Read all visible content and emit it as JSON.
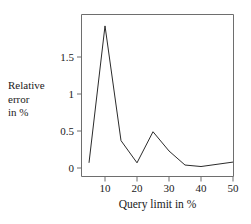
{
  "chart_data": {
    "type": "line",
    "title": "",
    "xlabel": "Query limit in %",
    "ylabel": "Relative error in %",
    "ylabel_lines": [
      "Relative",
      "error",
      "in %"
    ],
    "x": [
      5,
      10,
      15,
      20,
      25,
      30,
      35,
      40,
      45,
      50
    ],
    "values": [
      0.07,
      1.92,
      0.37,
      0.07,
      0.49,
      0.23,
      0.04,
      0.02,
      0.05,
      0.08
    ],
    "series": [
      {
        "name": "Relative error in %",
        "values": [
          0.07,
          1.92,
          0.37,
          0.07,
          0.49,
          0.23,
          0.04,
          0.02,
          0.05,
          0.08
        ]
      }
    ],
    "xlim": [
      4,
      51
    ],
    "ylim": [
      -0.06,
      2.05
    ],
    "xticks": [
      10,
      20,
      30,
      40,
      50
    ],
    "xtick_labels": [
      "10",
      "20",
      "30",
      "40",
      "50"
    ],
    "yticks": [
      0,
      0.5,
      1,
      1.5
    ],
    "ytick_labels": [
      "0",
      "0.5",
      "1",
      "1.5"
    ],
    "grid": false,
    "legend": false,
    "legend_position": "none",
    "line_color": "#2b2b2b",
    "frame_color": "#6e6e6e",
    "background": "#ffffff"
  }
}
